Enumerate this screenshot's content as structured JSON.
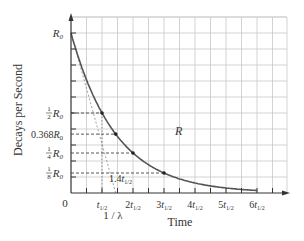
{
  "chart_data": {
    "type": "line",
    "title": "",
    "xlabel": "Time",
    "ylabel": "Decays per Second",
    "curve_label": "R",
    "origin_label": "0",
    "x_ticks": [
      "t1/2",
      "2t1/2",
      "3t1/2",
      "4t1/2",
      "5t1/2",
      "6t1/2"
    ],
    "y_ticks": [
      "R0",
      "1/2 R0",
      "0.368R0",
      "1/4 R0",
      "1/8 R0"
    ],
    "annotations": [
      "1.4t1/2",
      "1 / λ"
    ],
    "series": [
      {
        "name": "R",
        "function": "R0 * exp(-lambda * t)",
        "x": [
          0,
          1,
          1.4427,
          2,
          3,
          4,
          5,
          6
        ],
        "values": [
          1.0,
          0.5,
          0.368,
          0.25,
          0.125,
          0.0625,
          0.03125,
          0.015625
        ]
      }
    ],
    "marked_points": [
      {
        "x": "t1/2",
        "y": "1/2 R0"
      },
      {
        "x": "1/λ",
        "y": "0.368R0"
      },
      {
        "x": "2t1/2",
        "y": "1/4 R0"
      },
      {
        "x": "3t1/2",
        "y": "1/8 R0"
      }
    ],
    "xlim": [
      0,
      7
    ],
    "ylim": [
      0,
      1.1
    ],
    "grid": true
  },
  "colors": {
    "curve": "#555555",
    "grid": "#c8c8c8",
    "axis": "#333333",
    "text": "#333333"
  }
}
